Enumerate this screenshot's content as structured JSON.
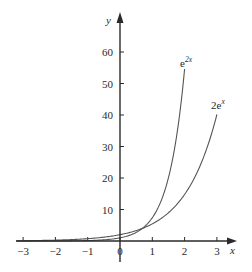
{
  "chart_data": {
    "type": "line",
    "title": "",
    "xlabel": "x",
    "ylabel": "y",
    "xlim": [
      -3.2,
      3.6
    ],
    "ylim": [
      0,
      68
    ],
    "grid": false,
    "legend": "inline labels near curve ends",
    "x_ticks": [
      -3,
      -2,
      -1,
      0,
      1,
      2,
      3
    ],
    "x_tick_labels": [
      "−3",
      "−2",
      "−1",
      "0",
      "1",
      "2",
      "3"
    ],
    "y_ticks": [
      10,
      20,
      30,
      40,
      50,
      60
    ],
    "y_tick_labels": [
      "10",
      "20",
      "30",
      "40",
      "50",
      "60"
    ],
    "series": [
      {
        "name": "e^{2x}",
        "label_base": "e",
        "label_sup": "2x",
        "function": "exp(2x)",
        "x": [
          -3,
          -2.5,
          -2,
          -1.5,
          -1,
          -0.5,
          0,
          0.5,
          1,
          1.25,
          1.5,
          1.75,
          2
        ],
        "values": [
          0.0025,
          0.0067,
          0.018,
          0.05,
          0.135,
          0.368,
          1,
          2.72,
          7.39,
          12.18,
          20.09,
          33.12,
          54.6
        ]
      },
      {
        "name": "2e^{x}",
        "label_base": "2e",
        "label_sup": "x",
        "function": "2*exp(x)",
        "x": [
          -3,
          -2.5,
          -2,
          -1.5,
          -1,
          -0.5,
          0,
          0.5,
          1,
          1.5,
          2,
          2.5,
          3
        ],
        "values": [
          0.1,
          0.164,
          0.271,
          0.446,
          0.736,
          1.213,
          2,
          3.3,
          5.44,
          8.96,
          14.78,
          24.36,
          40.17
        ]
      }
    ],
    "annotations": [
      {
        "text": "e^{2x}",
        "near": [
          2,
          54.6
        ]
      },
      {
        "text": "2e^{x}",
        "near": [
          3,
          40.2
        ]
      }
    ]
  },
  "axes": {
    "x_label": "x",
    "y_label": "y"
  },
  "colors": {
    "axis": "#2a2a2a",
    "curve": "#555555",
    "text": "#2a2a2a"
  }
}
